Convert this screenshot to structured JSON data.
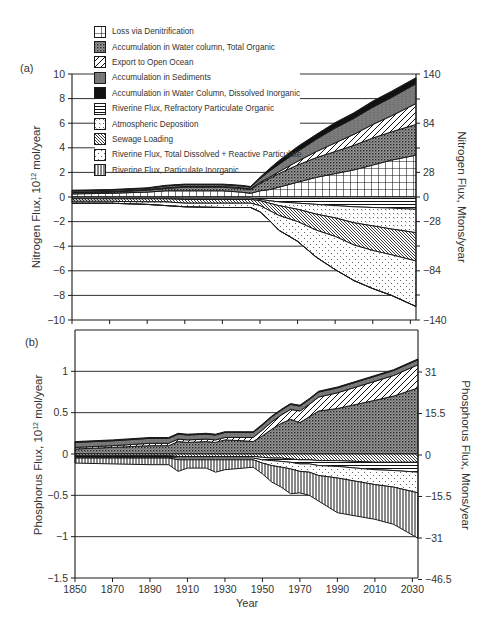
{
  "chart_data": [
    {
      "panel": "(a)",
      "type": "area",
      "stacked": true,
      "title": "",
      "xlabel": "",
      "ylabel": "Nitrogen Flux, 10^12 mol/year",
      "ylabel_right": "Nitrogen Flux, Mtons/year",
      "ylim": [
        -10,
        10
      ],
      "yticks": [
        10,
        8,
        6,
        4,
        2,
        0,
        -2,
        -4,
        -6,
        -8,
        -10
      ],
      "yticks_right": [
        140,
        84,
        28,
        0,
        -28,
        -84,
        -140
      ],
      "xlim": [
        1850,
        2033
      ],
      "grid": "horizontal",
      "x": [
        1850,
        1870,
        1890,
        1900,
        1910,
        1930,
        1940,
        1945,
        1950,
        1955,
        1960,
        1970,
        1980,
        1990,
        2000,
        2010,
        2020,
        2033
      ],
      "series": [
        {
          "name": "Loss via Denitrification",
          "pattern": "grid",
          "sign": "positive",
          "values": [
            0.25,
            0.3,
            0.4,
            0.5,
            0.5,
            0.5,
            0.4,
            0.3,
            0.5,
            0.6,
            0.8,
            1.2,
            1.6,
            1.9,
            2.2,
            2.6,
            3.0,
            3.4
          ]
        },
        {
          "name": "Accumulation in Water column, Total Organic",
          "pattern": "dense-dots",
          "sign": "positive",
          "values": [
            0.1,
            0.1,
            0.15,
            0.2,
            0.3,
            0.3,
            0.3,
            0.3,
            0.6,
            0.9,
            1.1,
            1.4,
            1.6,
            1.8,
            2.0,
            2.2,
            2.3,
            2.5
          ]
        },
        {
          "name": "Export to Open Ocean",
          "pattern": "diagonal",
          "sign": "positive",
          "values": [
            0.05,
            0.05,
            0.05,
            0.05,
            0.05,
            0.05,
            0.05,
            0.05,
            0.1,
            0.1,
            0.15,
            0.3,
            0.5,
            0.7,
            0.9,
            1.1,
            1.3,
            1.7
          ]
        },
        {
          "name": "Accumulation in Sediments",
          "pattern": "zigzag",
          "sign": "positive",
          "values": [
            0.1,
            0.1,
            0.1,
            0.15,
            0.15,
            0.15,
            0.15,
            0.15,
            0.3,
            0.5,
            0.6,
            0.8,
            1.0,
            1.2,
            1.3,
            1.4,
            1.5,
            1.6
          ]
        },
        {
          "name": "Accumulation in Water Column, Dissolved Inorganic",
          "pattern": "solid-black",
          "sign": "positive",
          "values": [
            0.05,
            0.05,
            0.05,
            0.05,
            0.05,
            0.05,
            0.05,
            0.05,
            0.1,
            0.2,
            0.3,
            0.4,
            0.4,
            0.45,
            0.45,
            0.5,
            0.5,
            0.5
          ]
        },
        {
          "name": "Riverine Flux, Refractory Particulate Organic",
          "pattern": "horizontal",
          "sign": "negative",
          "values": [
            -0.1,
            -0.1,
            -0.1,
            -0.1,
            -0.1,
            -0.1,
            -0.1,
            -0.1,
            -0.2,
            -0.3,
            -0.4,
            -0.5,
            -0.6,
            -0.7,
            -0.8,
            -0.85,
            -0.9,
            -1.0
          ]
        },
        {
          "name": "Atmospheric Deposition",
          "pattern": "crosses",
          "sign": "negative",
          "values": [
            -0.05,
            -0.05,
            -0.05,
            -0.05,
            -0.1,
            -0.1,
            -0.1,
            -0.1,
            -0.1,
            -0.2,
            -0.3,
            -0.5,
            -0.8,
            -1.0,
            -1.3,
            -1.5,
            -1.7,
            -1.9
          ]
        },
        {
          "name": "Sewage Loading",
          "pattern": "diagonal-dense",
          "sign": "negative",
          "values": [
            -0.2,
            -0.2,
            -0.25,
            -0.25,
            -0.3,
            -0.3,
            -0.3,
            -0.3,
            -0.4,
            -0.6,
            -0.8,
            -1.0,
            -1.3,
            -1.5,
            -1.8,
            -2.0,
            -2.1,
            -2.3
          ]
        },
        {
          "name": "Riverine Flux, Total Dissolved + Reactive Particulate",
          "pattern": "sparse-dots",
          "sign": "negative",
          "values": [
            -0.15,
            -0.15,
            -0.2,
            -0.3,
            -0.3,
            -0.35,
            -0.35,
            -0.35,
            -0.5,
            -0.8,
            -1.2,
            -1.6,
            -2.2,
            -2.7,
            -2.9,
            -3.1,
            -3.3,
            -3.7
          ]
        },
        {
          "name": "Riverine Flux, Particulate Inorganic",
          "pattern": "vertical",
          "sign": "negative",
          "values": [
            0,
            0,
            0,
            0,
            0,
            0,
            0,
            0,
            0,
            0,
            0,
            0,
            0,
            0,
            0,
            0,
            0,
            0
          ]
        }
      ]
    },
    {
      "panel": "(b)",
      "type": "area",
      "stacked": true,
      "title": "",
      "xlabel": "Year",
      "ylabel": "Phosphorus Flux, 10^12 mol/year",
      "ylabel_right": "Phosphorus Flux, Mtons/year",
      "ylim": [
        -1.5,
        1.5
      ],
      "yticks": [
        1,
        0.5,
        0,
        -0.5,
        -1,
        -1.5
      ],
      "yticks_right": [
        31,
        15.5,
        0,
        -15.5,
        -31,
        -46.5
      ],
      "xlim": [
        1850,
        2033
      ],
      "xticks": [
        1850,
        1870,
        1890,
        1910,
        1930,
        1950,
        1970,
        1990,
        2010,
        2030
      ],
      "grid": "horizontal",
      "x": [
        1850,
        1870,
        1890,
        1900,
        1905,
        1910,
        1920,
        1925,
        1930,
        1940,
        1945,
        1950,
        1955,
        1960,
        1965,
        1970,
        1975,
        1980,
        1990,
        2000,
        2010,
        2020,
        2033
      ],
      "series": [
        {
          "name": "Accumulation in Water column, Total Organic",
          "pattern": "dense-dots",
          "sign": "positive",
          "values": [
            0.06,
            0.08,
            0.1,
            0.1,
            0.15,
            0.14,
            0.15,
            0.14,
            0.17,
            0.16,
            0.15,
            0.22,
            0.3,
            0.37,
            0.42,
            0.38,
            0.45,
            0.52,
            0.55,
            0.6,
            0.65,
            0.7,
            0.8
          ]
        },
        {
          "name": "Export to Open Ocean",
          "pattern": "diagonal",
          "sign": "positive",
          "values": [
            0.02,
            0.02,
            0.03,
            0.03,
            0.03,
            0.03,
            0.03,
            0.03,
            0.03,
            0.04,
            0.05,
            0.07,
            0.09,
            0.1,
            0.12,
            0.14,
            0.15,
            0.17,
            0.19,
            0.21,
            0.23,
            0.25,
            0.28
          ]
        },
        {
          "name": "Accumulation in Sediments",
          "pattern": "zigzag",
          "sign": "positive",
          "values": [
            0.06,
            0.06,
            0.06,
            0.06,
            0.06,
            0.06,
            0.06,
            0.06,
            0.06,
            0.06,
            0.06,
            0.06,
            0.06,
            0.06,
            0.06,
            0.06,
            0.06,
            0.06,
            0.06,
            0.06,
            0.06,
            0.06,
            0.06
          ]
        },
        {
          "name": "Accumulation in Water Column, Dissolved Inorganic",
          "pattern": "solid-black",
          "sign": "positive",
          "values": [
            0.01,
            0.01,
            0.01,
            0.01,
            0.01,
            0.01,
            0.01,
            0.01,
            0.01,
            0.01,
            0.01,
            0.01,
            0.01,
            0.01,
            0.01,
            0.01,
            0.01,
            0.01,
            0.01,
            0.01,
            0.01,
            0.01,
            0.01
          ]
        },
        {
          "name": "Sewage Loading",
          "pattern": "diagonal-dense",
          "sign": "negative",
          "values": [
            -0.02,
            -0.02,
            -0.02,
            -0.02,
            -0.03,
            -0.03,
            -0.03,
            -0.03,
            -0.03,
            -0.03,
            -0.03,
            -0.04,
            -0.05,
            -0.05,
            -0.06,
            -0.07,
            -0.07,
            -0.08,
            -0.08,
            -0.09,
            -0.1,
            -0.1,
            -0.1
          ]
        },
        {
          "name": "Riverine Flux, Refractory Particulate Organic",
          "pattern": "horizontal",
          "sign": "negative",
          "values": [
            -0.02,
            -0.02,
            -0.02,
            -0.02,
            -0.02,
            -0.02,
            -0.02,
            -0.02,
            -0.02,
            -0.02,
            -0.02,
            -0.03,
            -0.03,
            -0.04,
            -0.04,
            -0.05,
            -0.05,
            -0.06,
            -0.07,
            -0.08,
            -0.09,
            -0.1,
            -0.12
          ]
        },
        {
          "name": "Riverine Flux, Total Dissolved + Reactive Particulate",
          "pattern": "sparse-dots",
          "sign": "negative",
          "values": [
            -0.01,
            -0.01,
            -0.01,
            -0.01,
            -0.02,
            -0.02,
            -0.02,
            -0.02,
            -0.02,
            -0.02,
            -0.02,
            -0.04,
            -0.06,
            -0.07,
            -0.08,
            -0.09,
            -0.1,
            -0.12,
            -0.14,
            -0.16,
            -0.18,
            -0.2,
            -0.25
          ]
        },
        {
          "name": "Riverine Flux, Particulate Inorganic",
          "pattern": "vertical",
          "sign": "negative",
          "values": [
            -0.06,
            -0.07,
            -0.08,
            -0.08,
            -0.14,
            -0.1,
            -0.1,
            -0.15,
            -0.12,
            -0.1,
            -0.09,
            -0.13,
            -0.2,
            -0.24,
            -0.3,
            -0.26,
            -0.28,
            -0.31,
            -0.42,
            -0.42,
            -0.42,
            -0.45,
            -0.55
          ]
        }
      ]
    }
  ],
  "legend": {
    "items": [
      {
        "label": "Loss via Denitrification",
        "pattern": "grid"
      },
      {
        "label": "Accumulation in Water column, Total Organic",
        "pattern": "dense-dots"
      },
      {
        "label": "Export to Open Ocean",
        "pattern": "diagonal"
      },
      {
        "label": "Accumulation in Sediments",
        "pattern": "zigzag"
      },
      {
        "label": "Accumulation in Water Column, Dissolved Inorganic",
        "pattern": "solid-black"
      },
      {
        "label": "Riverine Flux, Refractory Particulate Organic",
        "pattern": "horizontal"
      },
      {
        "label": "Atmospheric Deposition",
        "pattern": "crosses"
      },
      {
        "label": "Sewage Loading",
        "pattern": "diagonal-dense"
      },
      {
        "label": "Riverine Flux, Total Dissolved + Reactive Particulate",
        "pattern": "sparse-dots"
      },
      {
        "label": "Riverine Flux, Particulate Inorganic",
        "pattern": "vertical"
      }
    ]
  },
  "labels": {
    "panel_a": "(a)",
    "panel_b": "(b)",
    "a_ylabel_left": "Nitrogen Flux, 10",
    "a_ylabel_left_sup": "12",
    "a_ylabel_left_tail": " mol/year",
    "a_ylabel_right": "Nitrogen Flux, Mtons/year",
    "b_ylabel_left": "Phosphorus Flux, 10",
    "b_ylabel_left_sup": "12",
    "b_ylabel_left_tail": " mol/year",
    "b_ylabel_right": "Phosphorus Flux, Mtons/year",
    "xlabel": "Year"
  },
  "colors": {
    "ink": "#1a1a1a",
    "text": "#333333",
    "background": "#ffffff"
  }
}
